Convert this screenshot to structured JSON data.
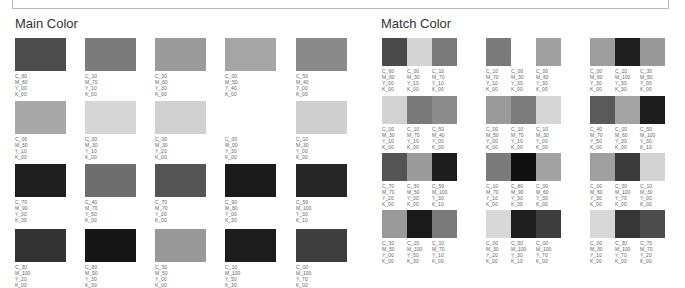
{
  "sections": {
    "main_title": "Main Color",
    "match_title": "Match Color"
  },
  "main": [
    {
      "hex": "#4d4d4d",
      "c": "C_60",
      "m": "M_60",
      "y": "Y_00",
      "k": "K_00"
    },
    {
      "hex": "#7b7b7b",
      "c": "C_10",
      "m": "M_70",
      "y": "Y_10",
      "k": "K_00"
    },
    {
      "hex": "#9a9a9a",
      "c": "C_00",
      "m": "M_60",
      "y": "Y_30",
      "k": "K_00"
    },
    {
      "hex": "#a5a5a5",
      "c": "C_00",
      "m": "M_50",
      "y": "Y_40",
      "k": "K_00"
    },
    {
      "hex": "#8a8a8a",
      "c": "C_50",
      "m": "M_40",
      "y": "Y_00",
      "k": "K_00"
    },
    {
      "hex": "#a8a8a8",
      "c": "C_06",
      "m": "M_50",
      "y": "Y_10",
      "k": "K_00"
    },
    {
      "hex": "#d6d6d6",
      "c": "C_00",
      "m": "M_30",
      "y": "Y_10",
      "k": "K_00"
    },
    {
      "hex": "#d0d0d0",
      "c": "C_00",
      "m": "M_30",
      "y": "Y_20",
      "k": "K_00"
    },
    {
      "hex": "#ffffff",
      "c": "C_00",
      "m": "M_00",
      "y": "Y_30",
      "k": "K_00"
    },
    {
      "hex": "#cfcfcf",
      "c": "C_10",
      "m": "M_30",
      "y": "Y_00",
      "k": "K_00"
    },
    {
      "hex": "#1e1e1e",
      "c": "C_70",
      "m": "M_90",
      "y": "Y_00",
      "k": "K_30"
    },
    {
      "hex": "#6e6e6e",
      "c": "C_40",
      "m": "M_70",
      "y": "Y_50",
      "k": "K_00"
    },
    {
      "hex": "#555555",
      "c": "C_70",
      "m": "M_70",
      "y": "Y_20",
      "k": "K_00"
    },
    {
      "hex": "#1a1a1a",
      "c": "C_90",
      "m": "M_80",
      "y": "Y_00",
      "k": "K_30"
    },
    {
      "hex": "#262626",
      "c": "C_50",
      "m": "M_100",
      "y": "Y_30",
      "k": "K_10"
    },
    {
      "hex": "#333333",
      "c": "C_30",
      "m": "M_100",
      "y": "Y_20",
      "k": "K_00"
    },
    {
      "hex": "#161616",
      "c": "C_80",
      "m": "M_90",
      "y": "Y_30",
      "k": "K_30"
    },
    {
      "hex": "#999999",
      "c": "C_30",
      "m": "M_50",
      "y": "Y_00",
      "k": "K_00"
    },
    {
      "hex": "#1c1c1c",
      "c": "C_10",
      "m": "M_100",
      "y": "Y_50",
      "k": "K_30"
    },
    {
      "hex": "#3e3e3e",
      "c": "C_00",
      "m": "M_100",
      "y": "Y_70",
      "k": "K_00"
    }
  ],
  "match": [
    [
      {
        "hex": "#4a4a4a",
        "c": "C_60",
        "m": "M_60",
        "y": "Y_00",
        "k": "K_00"
      },
      {
        "hex": "#d4d4d4",
        "c": "C_00",
        "m": "M_30",
        "y": "Y_10",
        "k": "K_00"
      },
      {
        "hex": "#7a7a7a",
        "c": "C_10",
        "m": "M_70",
        "y": "Y_10",
        "k": "K_00"
      }
    ],
    [
      {
        "hex": "#7a7a7a",
        "c": "C_10",
        "m": "M_70",
        "y": "Y_10",
        "k": "K_00"
      },
      {
        "hex": "#ffffff",
        "c": "C_00",
        "m": "M_30",
        "y": "Y_30",
        "k": "K_00"
      },
      {
        "hex": "#a0a0a0",
        "c": "C_00",
        "m": "M_60",
        "y": "Y_30",
        "k": "K_00"
      }
    ],
    [
      {
        "hex": "#9e9e9e",
        "c": "C_00",
        "m": "M_60",
        "y": "Y_30",
        "k": "K_00"
      },
      {
        "hex": "#1f1f1f",
        "c": "C_10",
        "m": "M_100",
        "y": "Y_50",
        "k": "K_30"
      },
      {
        "hex": "#999999",
        "c": "C_30",
        "m": "M_50",
        "y": "Y_00",
        "k": "K_00"
      }
    ],
    [
      {
        "hex": "#d2d2d2",
        "c": "C_00",
        "m": "M_30",
        "y": "Y_10",
        "k": "K_00"
      },
      {
        "hex": "#797979",
        "c": "C_10",
        "m": "M_70",
        "y": "Y_10",
        "k": "K_00"
      },
      {
        "hex": "#8b8b8b",
        "c": "C_50",
        "m": "M_40",
        "y": "Y_00",
        "k": "K_00"
      }
    ],
    [
      {
        "hex": "#9a9a9a",
        "c": "C_00",
        "m": "M_50",
        "y": "Y_00",
        "k": "K_00"
      },
      {
        "hex": "#7c7c7c",
        "c": "C_10",
        "m": "M_70",
        "y": "Y_10",
        "k": "K_00"
      },
      {
        "hex": "#d6d6d6",
        "c": "C_10",
        "m": "M_30",
        "y": "Y_00",
        "k": "K_00"
      }
    ],
    [
      {
        "hex": "#5a5a5a",
        "c": "C_40",
        "m": "M_70",
        "y": "Y_50",
        "k": "K_00"
      },
      {
        "hex": "#a3a3a3",
        "c": "C_00",
        "m": "M_60",
        "y": "Y_30",
        "k": "K_00"
      },
      {
        "hex": "#1c1c1c",
        "c": "C_50",
        "m": "M_100",
        "y": "Y_30",
        "k": "K_10"
      }
    ],
    [
      {
        "hex": "#545454",
        "c": "C_70",
        "m": "M_70",
        "y": "Y_20",
        "k": "K_00"
      },
      {
        "hex": "#9b9b9b",
        "c": "C_30",
        "m": "M_50",
        "y": "Y_00",
        "k": "K_00"
      },
      {
        "hex": "#1d1d1d",
        "c": "C_50",
        "m": "M_100",
        "y": "Y_30",
        "k": "K_10"
      }
    ],
    [
      {
        "hex": "#7b7b7b",
        "c": "C_10",
        "m": "M_70",
        "y": "Y_10",
        "k": "K_00"
      },
      {
        "hex": "#0f0f0f",
        "c": "C_80",
        "m": "M_90",
        "y": "Y_30",
        "k": "K_30"
      },
      {
        "hex": "#a2a2a2",
        "c": "C_00",
        "m": "M_60",
        "y": "Y_30",
        "k": "K_00"
      }
    ],
    [
      {
        "hex": "#a0a0a0",
        "c": "C_00",
        "m": "M_60",
        "y": "Y_30",
        "k": "K_00"
      },
      {
        "hex": "#3a3a3a",
        "c": "C_30",
        "m": "M_100",
        "y": "Y_70",
        "k": "K_00"
      },
      {
        "hex": "#d3d3d3",
        "c": "C_10",
        "m": "M_30",
        "y": "Y_00",
        "k": "K_00"
      }
    ],
    [
      {
        "hex": "#9a9a9a",
        "c": "C_30",
        "m": "M_50",
        "y": "Y_00",
        "k": "K_00"
      },
      {
        "hex": "#1a1a1a",
        "c": "C_10",
        "m": "M_100",
        "y": "Y_50",
        "k": "K_30"
      },
      {
        "hex": "#7a7a7a",
        "c": "C_10",
        "m": "M_70",
        "y": "Y_10",
        "k": "K_00"
      }
    ],
    [
      {
        "hex": "#d8d8d8",
        "c": "C_00",
        "m": "M_30",
        "y": "Y_20",
        "k": "K_00"
      },
      {
        "hex": "#1e1e1e",
        "c": "C_50",
        "m": "M_100",
        "y": "Y_30",
        "k": "K_10"
      },
      {
        "hex": "#3c3c3c",
        "c": "C_00",
        "m": "M_100",
        "y": "Y_70",
        "k": "K_00"
      }
    ],
    [
      {
        "hex": "#d8d8d8",
        "c": "C_00",
        "m": "M_30",
        "y": "Y_10",
        "k": "K_00"
      },
      {
        "hex": "#363636",
        "c": "C_30",
        "m": "M_100",
        "y": "Y_70",
        "k": "K_00"
      },
      {
        "hex": "#4c4c4c",
        "c": "C_70",
        "m": "M_70",
        "y": "Y_20",
        "k": "K_00"
      }
    ]
  ]
}
